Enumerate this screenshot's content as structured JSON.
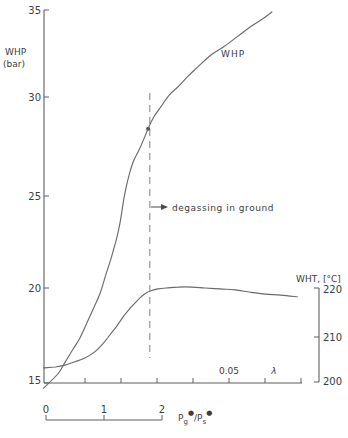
{
  "colors": {
    "background": "#ffffff",
    "line": "#6a6a6a",
    "text": "#3c3c3c",
    "dashed": "#8c8c8c"
  },
  "chart_data": {
    "type": "line",
    "title": "",
    "grid": false,
    "axes": {
      "left": {
        "title1": "WHP",
        "title2": "(bar)",
        "tick_labels": [
          "35",
          "30",
          "25",
          "20",
          "15"
        ],
        "tick_values": [
          35,
          30,
          25,
          20,
          15
        ],
        "range": [
          15,
          35
        ]
      },
      "right": {
        "title": "WHT, [°C]",
        "tick_labels": [
          "220",
          "210",
          "200"
        ],
        "tick_values": [
          220,
          210,
          200
        ],
        "range": [
          200,
          220
        ]
      },
      "lambda": {
        "tick_label": "0.05",
        "symbol": "λ"
      },
      "ratio": {
        "tick_labels": [
          "0",
          "1",
          "2"
        ],
        "label_parts": {
          "P1": "P",
          "sub1": "g",
          "sup1": "●",
          "slash": "/",
          "P2": "P",
          "sub2": "s",
          "sup2": "●"
        }
      }
    },
    "series": [
      {
        "name": "WHP",
        "axis": "left",
        "x_unit": "Pg*/Ps* ratio",
        "y_unit": "bar",
        "points": [
          [
            -0.05,
            14.7
          ],
          [
            0.21,
            15.5
          ],
          [
            0.33,
            16.1
          ],
          [
            0.47,
            16.8
          ],
          [
            0.59,
            17.4
          ],
          [
            0.71,
            18.2
          ],
          [
            0.83,
            19.0
          ],
          [
            0.93,
            19.7
          ],
          [
            1.03,
            20.7
          ],
          [
            1.12,
            21.6
          ],
          [
            1.21,
            22.6
          ],
          [
            1.28,
            23.6
          ],
          [
            1.34,
            24.8
          ],
          [
            1.41,
            25.8
          ],
          [
            1.5,
            26.7
          ],
          [
            1.6,
            27.3
          ],
          [
            1.69,
            27.9
          ],
          [
            1.76,
            28.4
          ],
          [
            1.86,
            29.0
          ],
          [
            1.98,
            29.5
          ],
          [
            2.12,
            30.1
          ],
          [
            2.28,
            30.6
          ],
          [
            2.45,
            31.2
          ],
          [
            2.64,
            31.8
          ],
          [
            2.84,
            32.4
          ],
          [
            3.07,
            32.9
          ],
          [
            3.31,
            33.5
          ],
          [
            3.55,
            34.1
          ],
          [
            3.74,
            34.5
          ],
          [
            3.9,
            34.9
          ]
        ]
      },
      {
        "name": "WHT",
        "axis": "right",
        "x_unit": "Pg*/Ps* ratio",
        "y_unit": "°C",
        "points": [
          [
            -0.05,
            203.0
          ],
          [
            0.16,
            203.2
          ],
          [
            0.33,
            203.6
          ],
          [
            0.5,
            204.3
          ],
          [
            0.67,
            205.1
          ],
          [
            0.84,
            206.4
          ],
          [
            0.98,
            208.1
          ],
          [
            1.1,
            210.0
          ],
          [
            1.22,
            211.9
          ],
          [
            1.34,
            214.0
          ],
          [
            1.45,
            215.7
          ],
          [
            1.55,
            217.0
          ],
          [
            1.64,
            218.1
          ],
          [
            1.72,
            218.9
          ],
          [
            1.81,
            219.4
          ],
          [
            1.93,
            219.8
          ],
          [
            2.07,
            220.0
          ],
          [
            2.28,
            220.2
          ],
          [
            2.52,
            220.2
          ],
          [
            2.74,
            220.0
          ],
          [
            3.0,
            219.8
          ],
          [
            3.26,
            219.6
          ],
          [
            3.52,
            219.1
          ],
          [
            3.78,
            218.7
          ],
          [
            4.05,
            218.5
          ],
          [
            4.34,
            218.1
          ]
        ]
      }
    ],
    "annotations": {
      "degassing": {
        "text": "degassing in ground",
        "x_ratio": 1.79,
        "point": [
          1.76,
          28.4
        ]
      }
    }
  }
}
